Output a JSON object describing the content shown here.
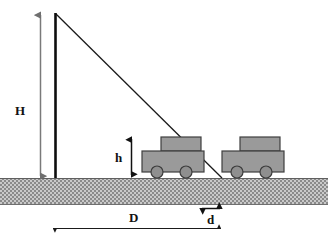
{
  "diagram": {
    "labels": {
      "pole_height": "H",
      "cart_height": "h",
      "ground_distance": "D",
      "cart_gap": "d"
    },
    "colors": {
      "ink": "#111111",
      "pole": "#0d0d0d",
      "ray": "#1a1a1a",
      "dimension_gray": "#7a7a7a",
      "cart_fill": "#9a9a9a",
      "cart_stroke": "#3c3c3c",
      "wheel_fill": "#8f8f8f",
      "ground_fill": "#b3b3b3",
      "ground_stroke": "#6b6b6b",
      "background": "#ffffff"
    },
    "geometry": {
      "pole": {
        "x": 55,
        "top_y": 13,
        "base_y": 178
      },
      "ray": {
        "x1": 55,
        "y1": 13,
        "x2": 222,
        "y2": 178
      },
      "ground": {
        "x": 0,
        "y": 178,
        "width": 328,
        "height": 27
      },
      "h_arrow": {
        "x": 131,
        "y1": 137,
        "y2": 177
      },
      "H_arrow": {
        "x": 40,
        "y1": 13,
        "y2": 178
      },
      "D_arrow": {
        "y": 228,
        "x1": 52,
        "x2": 222
      },
      "d_arrow": {
        "y": 208,
        "x1": 200,
        "x2": 222
      },
      "cart_left": {
        "x": 142,
        "y": 137,
        "body_w": 62,
        "body_h": 22,
        "box_w": 38,
        "box_h": 14
      },
      "cart_right": {
        "x": 222,
        "y": 137,
        "body_w": 62,
        "body_h": 22,
        "box_w": 38,
        "box_h": 14
      }
    }
  }
}
